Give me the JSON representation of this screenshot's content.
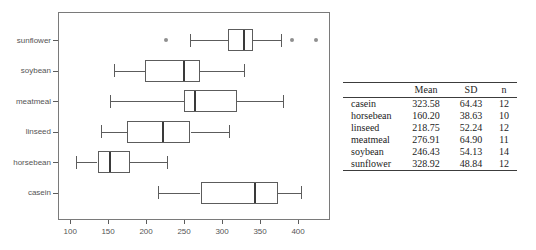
{
  "chart_data": {
    "type": "boxplot",
    "orientation": "horizontal",
    "title": "",
    "xlabel": "",
    "ylabel": "",
    "grid": false,
    "xlim": [
      84,
      442
    ],
    "xticks": [
      100,
      150,
      200,
      250,
      300,
      350,
      400
    ],
    "categories_top_to_bottom": [
      "sunflower",
      "soybean",
      "meatmeal",
      "linseed",
      "horsebean",
      "casein"
    ],
    "boxes": [
      {
        "label": "sunflower",
        "whisker_low": 258,
        "q1": 307.5,
        "median": 328,
        "q3": 340.5,
        "whisker_high": 378,
        "outliers": [
          226,
          392,
          423
        ]
      },
      {
        "label": "soybean",
        "whisker_low": 158,
        "q1": 199,
        "median": 248,
        "q3": 271,
        "whisker_high": 329,
        "outliers": []
      },
      {
        "label": "meatmeal",
        "whisker_low": 153,
        "q1": 249.5,
        "median": 263,
        "q3": 320,
        "whisker_high": 380,
        "outliers": []
      },
      {
        "label": "linseed",
        "whisker_low": 141,
        "q1": 175,
        "median": 221,
        "q3": 258.5,
        "whisker_high": 309,
        "outliers": []
      },
      {
        "label": "horsebean",
        "whisker_low": 108,
        "q1": 136,
        "median": 151.5,
        "q3": 179,
        "whisker_high": 227,
        "outliers": []
      },
      {
        "label": "casein",
        "whisker_low": 216,
        "q1": 271.5,
        "median": 342,
        "q3": 373.5,
        "whisker_high": 404,
        "outliers": []
      }
    ],
    "colors": {
      "line": "#5c5c5c",
      "median": "#3a3a3a",
      "outlier": "#8f8f8f",
      "frame": "#7a7a7a",
      "tick_label": "#555555"
    }
  },
  "table": {
    "headers": [
      "",
      "Mean",
      "SD",
      "n"
    ],
    "rows": [
      {
        "label": "casein",
        "mean": "323.58",
        "sd": "64.43",
        "n": "12"
      },
      {
        "label": "horsebean",
        "mean": "160.20",
        "sd": "38.63",
        "n": "10"
      },
      {
        "label": "linseed",
        "mean": "218.75",
        "sd": "52.24",
        "n": "12"
      },
      {
        "label": "meatmeal",
        "mean": "276.91",
        "sd": "64.90",
        "n": "11"
      },
      {
        "label": "soybean",
        "mean": "246.43",
        "sd": "54.13",
        "n": "14"
      },
      {
        "label": "sunflower",
        "mean": "328.92",
        "sd": "48.84",
        "n": "12"
      }
    ]
  }
}
